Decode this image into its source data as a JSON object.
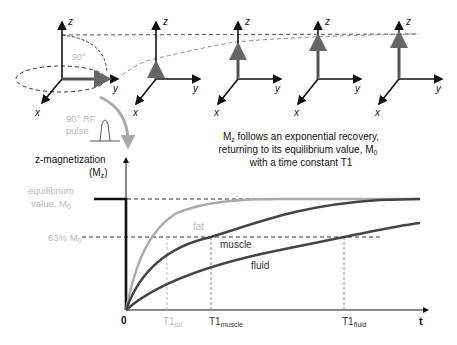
{
  "axes_frames": [
    {
      "z": "z",
      "y": "y",
      "x": "x",
      "angle": "90°"
    },
    {
      "z": "z",
      "y": "y",
      "x": "x"
    },
    {
      "z": "z",
      "y": "y",
      "x": "x"
    },
    {
      "z": "z",
      "y": "y",
      "x": "x"
    },
    {
      "z": "z",
      "y": "y",
      "x": "x"
    }
  ],
  "rf_pulse": {
    "line1": "90° RF",
    "line2": "pulse"
  },
  "caption": {
    "line1_pre": "M",
    "line1_sub": "z",
    "line1_post": " follows an exponential recovery,",
    "line2_pre": "returning to its equilibrium value, M",
    "line2_sub": "0",
    "line3": "with a time constant T1"
  },
  "graph": {
    "ylabel_line1": "z-magnetization",
    "ylabel_line2_pre": "(M",
    "ylabel_line2_sub": "z",
    "ylabel_line2_post": ")",
    "equilibrium_line1": "equilibrium",
    "equilibrium_line2_pre": "value, M",
    "equilibrium_line2_sub": "0",
    "pct_pre": "63% M",
    "pct_sub": "0",
    "origin": "0",
    "xlabel": "t",
    "curves": [
      {
        "name": "fat",
        "label": "fat",
        "color": "#aaaaaa"
      },
      {
        "name": "muscle",
        "label": "muscle",
        "color": "#444444"
      },
      {
        "name": "fluid",
        "label": "fluid",
        "color": "#444444"
      }
    ],
    "ticks": [
      {
        "main": "T1",
        "sub": "fat",
        "color": "#bbbbbb"
      },
      {
        "main": "T1",
        "sub": "muscle",
        "color": "#333333"
      },
      {
        "main": "T1",
        "sub": "fluid",
        "color": "#333333"
      }
    ]
  }
}
